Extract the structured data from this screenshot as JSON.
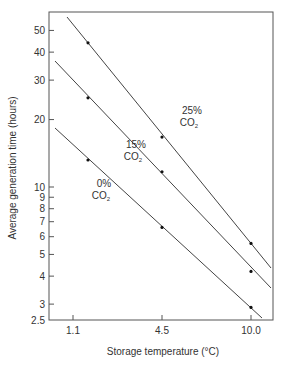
{
  "chart_data": {
    "type": "line",
    "title": "",
    "xlabel": "Storage temperature (°C)",
    "ylabel": "Average generation time (hours)",
    "yscale": "log",
    "ylim": [
      2.5,
      60
    ],
    "x_ticks": [
      "1.1",
      "4.5",
      "10.0"
    ],
    "y_ticks": [
      {
        "value": 2.5,
        "label": "2.5"
      },
      {
        "value": 3,
        "label": "3"
      },
      {
        "value": 4,
        "label": "4"
      },
      {
        "value": 5,
        "label": "5"
      },
      {
        "value": 6,
        "label": "6"
      },
      {
        "value": 7,
        "label": "7"
      },
      {
        "value": 8,
        "label": "8"
      },
      {
        "value": 9,
        "label": "9"
      },
      {
        "value": 10,
        "label": "10"
      },
      {
        "value": 20,
        "label": "20"
      },
      {
        "value": 30,
        "label": "30"
      },
      {
        "value": 40,
        "label": "40"
      },
      {
        "value": 50,
        "label": "50"
      }
    ],
    "x": [
      1.1,
      4.5,
      10.0
    ],
    "series": [
      {
        "name": "25% CO2",
        "label_top": "25%",
        "label_bottom": "CO",
        "label_sub": "2",
        "values": [
          44,
          16.7,
          5.6
        ]
      },
      {
        "name": "15% CO2",
        "label_top": "15%",
        "label_bottom": "CO",
        "label_sub": "2",
        "values": [
          25,
          11.7,
          4.2
        ]
      },
      {
        "name": "0% CO2",
        "label_top": "0%",
        "label_bottom": "CO",
        "label_sub": "2",
        "values": [
          13.2,
          6.6,
          2.9
        ]
      }
    ],
    "grid": false,
    "legend": "inline labels"
  }
}
